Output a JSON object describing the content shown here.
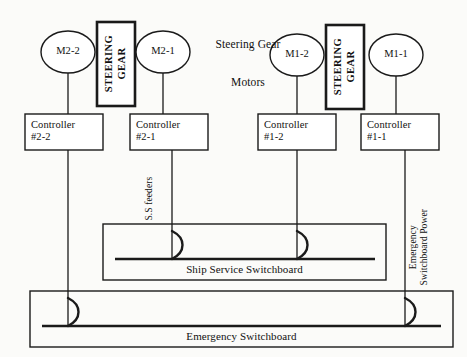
{
  "diagram": {
    "title_line1": "Steering Gear",
    "title_line2": "Motors",
    "background_color": "#fbfbf9",
    "line_color": "#1a1a1a"
  },
  "motors": [
    {
      "id": "m2-2",
      "label": "M2-2",
      "cx": 68,
      "cy": 52,
      "rx": 27,
      "ry": 21
    },
    {
      "id": "m2-1",
      "label": "M2-1",
      "cx": 163,
      "cy": 52,
      "rx": 27,
      "ry": 21
    },
    {
      "id": "m1-2",
      "label": "M1-2",
      "cx": 297,
      "cy": 55,
      "rx": 27,
      "ry": 21
    },
    {
      "id": "m1-1",
      "label": "M1-1",
      "cx": 396,
      "cy": 55,
      "rx": 27,
      "ry": 21
    }
  ],
  "steering_gears": [
    {
      "id": "sg-2",
      "line1": "STEERING",
      "line2": "GEAR",
      "x": 97,
      "y": 22,
      "w": 38,
      "h": 84
    },
    {
      "id": "sg-1",
      "line1": "STEERING",
      "line2": "GEAR",
      "x": 326,
      "y": 25,
      "w": 38,
      "h": 84
    }
  ],
  "controllers": [
    {
      "id": "ctrl-2-2",
      "line1": "Controller",
      "line2": "#2-2",
      "x": 25,
      "y": 114,
      "w": 78,
      "h": 36
    },
    {
      "id": "ctrl-2-1",
      "line1": "Controller",
      "line2": "#2-1",
      "x": 130,
      "y": 114,
      "w": 78,
      "h": 36
    },
    {
      "id": "ctrl-1-2",
      "line1": "Controller",
      "line2": "#1-2",
      "x": 258,
      "y": 114,
      "w": 78,
      "h": 36
    },
    {
      "id": "ctrl-1-1",
      "line1": "Controller",
      "line2": "#1-1",
      "x": 361,
      "y": 114,
      "w": 78,
      "h": 36
    }
  ],
  "switchboards": [
    {
      "id": "ship-service-switchboard",
      "caption": "Ship Service Switchboard",
      "x": 103,
      "y": 224,
      "w": 283,
      "h": 56,
      "bus_y": 259,
      "bus_x1": 115,
      "bus_x2": 375,
      "breakers": [
        172,
        297
      ]
    },
    {
      "id": "emergency-switchboard",
      "caption": "Emergency Switchboard",
      "x": 30,
      "y": 291,
      "w": 423,
      "h": 56,
      "bus_y": 326,
      "bus_x1": 42,
      "bus_x2": 441,
      "breakers": [
        68,
        405
      ]
    }
  ],
  "feeder_labels": [
    {
      "id": "ss-feeders",
      "text": "S.S feeders",
      "x": 150,
      "y": 200
    },
    {
      "id": "emergency-power",
      "line1": "Emergency",
      "line2": "Switchboard Power",
      "x": 419,
      "y": 248
    }
  ],
  "connections": [
    {
      "id": "m2-2-to-ctrl",
      "from": "M2-2",
      "to": "Controller #2-2",
      "x": 68,
      "y1": 73,
      "y2": 114
    },
    {
      "id": "m2-1-to-ctrl",
      "from": "M2-1",
      "to": "Controller #2-1",
      "x": 163,
      "y1": 73,
      "y2": 114
    },
    {
      "id": "m1-2-to-ctrl",
      "from": "M1-2",
      "to": "Controller #1-2",
      "x": 297,
      "y1": 76,
      "y2": 114
    },
    {
      "id": "m1-1-to-ctrl",
      "from": "M1-1",
      "to": "Controller #1-1",
      "x": 396,
      "y1": 76,
      "y2": 114
    },
    {
      "id": "ctrl-2-2-to-emergency",
      "from": "Controller #2-2",
      "to": "Emergency Switchboard",
      "x": 68,
      "y1": 150,
      "y2": 326
    },
    {
      "id": "ctrl-2-1-to-ship-service",
      "from": "Controller #2-1",
      "to": "Ship Service Switchboard",
      "x": 172,
      "y1": 150,
      "y2": 259
    },
    {
      "id": "ctrl-1-2-to-ship-service",
      "from": "Controller #1-2",
      "to": "Ship Service Switchboard",
      "x": 297,
      "y1": 150,
      "y2": 259
    },
    {
      "id": "ctrl-1-1-to-emergency",
      "from": "Controller #1-1",
      "to": "Emergency Switchboard",
      "x": 405,
      "y1": 150,
      "y2": 326
    }
  ]
}
